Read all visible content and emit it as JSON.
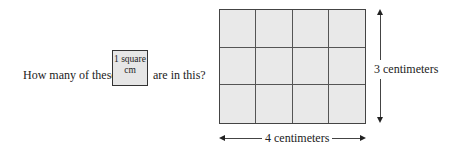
{
  "question": {
    "prefix": "How many of these",
    "suffix": "are in this?"
  },
  "unit_square": {
    "line1": "1 square",
    "line2": "cm"
  },
  "rectangle": {
    "rows": 3,
    "columns": 4,
    "fill_color": "#e9e9e9",
    "height_label": "3 centimeters",
    "width_label": "4 centimeters"
  }
}
